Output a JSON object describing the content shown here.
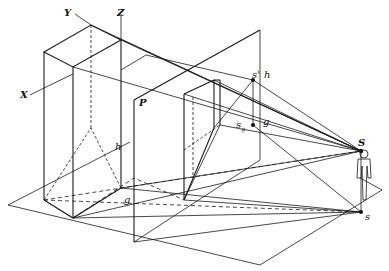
{
  "figure": {
    "type": "perspective-projection-diagram",
    "labels": {
      "y_axis": "Y",
      "z_axis": "Z",
      "x_axis": "X",
      "picture_plane": "P",
      "horizon_left": "h",
      "ground_line": "g",
      "vanishing_top": "s'",
      "horizon_right": "h",
      "station_point_proj": "s",
      "station_point_proj_sub": "g",
      "ground_right": "g",
      "eye_point": "S",
      "foot_point": "s"
    },
    "colors": {
      "stroke": "#1a1a1a",
      "background": "#ffffff"
    }
  }
}
